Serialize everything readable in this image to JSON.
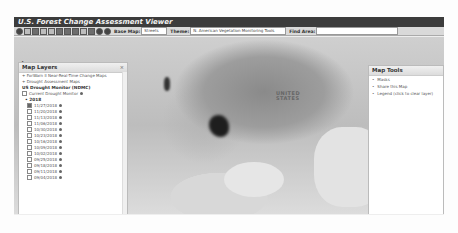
{
  "app": {
    "title": "U.S. Forest Change Assessment Viewer"
  },
  "toolbar": {
    "buttons": [
      "globe-icon",
      "layers-icon",
      "help-icon",
      "print-icon",
      "tool-icon-1",
      "tool-icon-2",
      "tool-icon-3",
      "tool-icon-4",
      "tool-icon-5",
      "tool-icon-6",
      "zoom-in-icon",
      "zoom-out-icon"
    ],
    "base_map_label": "Base Map:",
    "base_map_value": "Streets",
    "theme_label": "Theme:",
    "theme_value": "N. American Vegetation Monitoring Tools",
    "find_area_label": "Find Area:",
    "find_area_value": ""
  },
  "left_panel": {
    "title": "Map Layers",
    "close": "×",
    "items": [
      {
        "label": "ForWarn II Near-Real-Time Change Maps",
        "type": "section"
      },
      {
        "label": "Drought Assessment Maps",
        "type": "section"
      },
      {
        "label": "US Drought Monitor (NDMC)",
        "type": "heading"
      },
      {
        "label": "Current Drought Monitor",
        "type": "checkbox",
        "checked": false
      }
    ],
    "year": "2018",
    "dates": [
      {
        "label": "11/27/2018",
        "checked": true
      },
      {
        "label": "11/20/2018",
        "checked": false
      },
      {
        "label": "11/13/2018",
        "checked": false
      },
      {
        "label": "11/06/2018",
        "checked": false
      },
      {
        "label": "10/30/2018",
        "checked": false
      },
      {
        "label": "10/23/2018",
        "checked": false
      },
      {
        "label": "10/16/2018",
        "checked": false
      },
      {
        "label": "10/09/2018",
        "checked": false
      },
      {
        "label": "10/02/2018",
        "checked": false
      },
      {
        "label": "09/25/2018",
        "checked": false
      },
      {
        "label": "09/18/2018",
        "checked": false
      },
      {
        "label": "09/11/2018",
        "checked": false
      },
      {
        "label": "09/04/2018",
        "checked": false
      }
    ]
  },
  "right_panel": {
    "title": "Map Tools",
    "items": [
      "Masks",
      "Share this Map",
      "Legend (click to clear layer)"
    ]
  },
  "map": {
    "country_label_1": "UNITED",
    "country_label_2": "STATES"
  },
  "scale": {
    "top": "500 km",
    "bottom": "300 mi"
  }
}
